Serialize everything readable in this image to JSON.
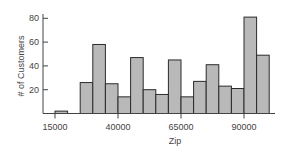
{
  "chart_data": {
    "type": "bar",
    "subtype": "histogram",
    "title": "",
    "xlabel": "Zip",
    "ylabel": "# of Customers",
    "bin_width": 5000,
    "bins": [
      {
        "start": 15000,
        "end": 20000,
        "count": 2
      },
      {
        "start": 20000,
        "end": 25000,
        "count": 0
      },
      {
        "start": 25000,
        "end": 30000,
        "count": 26
      },
      {
        "start": 30000,
        "end": 35000,
        "count": 58
      },
      {
        "start": 35000,
        "end": 40000,
        "count": 25
      },
      {
        "start": 40000,
        "end": 45000,
        "count": 14
      },
      {
        "start": 45000,
        "end": 50000,
        "count": 47
      },
      {
        "start": 50000,
        "end": 55000,
        "count": 20
      },
      {
        "start": 55000,
        "end": 60000,
        "count": 16
      },
      {
        "start": 60000,
        "end": 65000,
        "count": 45
      },
      {
        "start": 65000,
        "end": 70000,
        "count": 14
      },
      {
        "start": 70000,
        "end": 75000,
        "count": 27
      },
      {
        "start": 75000,
        "end": 80000,
        "count": 41
      },
      {
        "start": 80000,
        "end": 85000,
        "count": 23
      },
      {
        "start": 85000,
        "end": 90000,
        "count": 21
      },
      {
        "start": 90000,
        "end": 95000,
        "count": 81
      },
      {
        "start": 95000,
        "end": 100000,
        "count": 49
      }
    ],
    "x_ticks": [
      15000,
      40000,
      65000,
      90000
    ],
    "x_tick_labels": [
      "15000",
      "40000",
      "65000",
      "90000"
    ],
    "y_ticks": [
      20,
      40,
      60,
      80
    ],
    "y_tick_labels": [
      "20",
      "40",
      "60",
      "80"
    ],
    "ylim": [
      0,
      85
    ],
    "grid": false,
    "legend": null,
    "colors": {
      "bar_fill": "#b9b9b9",
      "bar_stroke": "#2b2b2b",
      "axis": "#444444"
    }
  }
}
